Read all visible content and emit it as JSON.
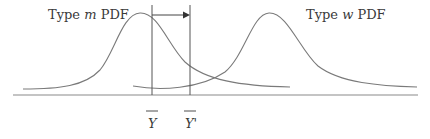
{
  "diagram": {
    "left_label": {
      "prefix": "Type ",
      "var": "m",
      "suffix": " PDF"
    },
    "right_label": {
      "prefix": "Type ",
      "var": "w",
      "suffix": " PDF"
    },
    "mean_label": "Y",
    "shifted_mean_label": "Y'",
    "colors": {
      "curve": "#7a7a7a",
      "line": "#555555",
      "axis": "#8a8a8a",
      "text": "#3a3a3a"
    }
  }
}
